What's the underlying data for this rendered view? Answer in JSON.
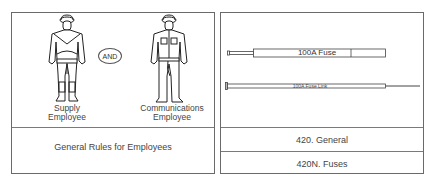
{
  "left_panel": {
    "figures": [
      {
        "name": "supply-employee",
        "caption_line1": "Supply",
        "caption_line2": "Employee"
      },
      {
        "name": "communications-employee",
        "caption_line1": "Communications",
        "caption_line2": "Employee"
      }
    ],
    "connector": "AND",
    "title": "General Rules for Employees"
  },
  "right_panel": {
    "fuse_label": "100A Fuse",
    "fuse_link_label": "100A Fuse Link",
    "rows": [
      "420. General",
      "420N. Fuses"
    ]
  }
}
